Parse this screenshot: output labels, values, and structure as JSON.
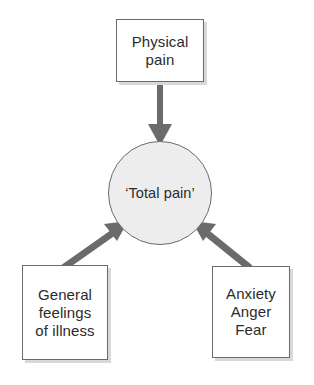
{
  "diagram": {
    "type": "node-link-diagram",
    "background_color": "#ffffff",
    "nodes": [
      {
        "id": "physical-pain",
        "shape": "rectangle",
        "label": "Physical\npain",
        "fill": "#ffffff",
        "stroke": "#6b6b6b",
        "shadow": "#d8d8d8"
      },
      {
        "id": "total-pain",
        "shape": "circle",
        "label": "‘Total pain’",
        "fill": "#ededed",
        "stroke": "#6b6b6b"
      },
      {
        "id": "general-feelings",
        "shape": "rectangle",
        "label": "General\nfeelings\nof illness",
        "fill": "#ffffff",
        "stroke": "#6b6b6b",
        "shadow": "#d8d8d8"
      },
      {
        "id": "anxiety-anger-fear",
        "shape": "rectangle",
        "label": "Anxiety\nAnger\nFear",
        "fill": "#ffffff",
        "stroke": "#6b6b6b",
        "shadow": "#d8d8d8"
      }
    ],
    "edges": [
      {
        "id": "edge-physical-to-total",
        "from": "physical-pain",
        "to": "total-pain",
        "direction": "down",
        "arrowhead": "filled-triangle",
        "color": "#6b6b6b"
      },
      {
        "id": "edge-general-to-total",
        "from": "general-feelings",
        "to": "total-pain",
        "direction": "up-right",
        "arrowhead": "filled-triangle",
        "color": "#6b6b6b"
      },
      {
        "id": "edge-anxiety-to-total",
        "from": "anxiety-anger-fear",
        "to": "total-pain",
        "direction": "up-left",
        "arrowhead": "filled-triangle",
        "color": "#6b6b6b"
      }
    ]
  }
}
